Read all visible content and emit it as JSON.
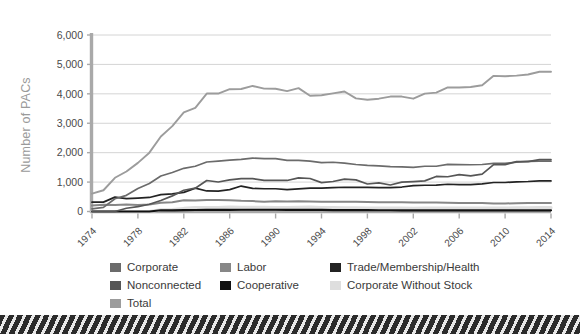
{
  "chart_data": {
    "type": "line",
    "title": "",
    "subtitle": "",
    "xlabel": "",
    "ylabel": "Number of PACs",
    "xlim": [
      1974,
      2014
    ],
    "ylim": [
      0,
      6000
    ],
    "grid": true,
    "legend_position": "bottom",
    "ytick_labels": [
      "6,000",
      "5,000",
      "4,000",
      "3,000",
      "2,000",
      "1,000",
      "0"
    ],
    "ytick_values": [
      6000,
      5000,
      4000,
      3000,
      2000,
      1000,
      0
    ],
    "xtick_labels": [
      "1974",
      "1978",
      "1982",
      "1986",
      "1990",
      "1994",
      "1998",
      "2002",
      "2006",
      "2010",
      "2014"
    ],
    "xtick_values": [
      1974,
      1978,
      1982,
      1986,
      1990,
      1994,
      1998,
      2002,
      2006,
      2010,
      2014
    ],
    "x": [
      1974,
      1975,
      1976,
      1977,
      1978,
      1979,
      1980,
      1981,
      1982,
      1983,
      1984,
      1985,
      1986,
      1987,
      1988,
      1989,
      1990,
      1991,
      1992,
      1993,
      1994,
      1995,
      1996,
      1997,
      1998,
      1999,
      2000,
      2001,
      2002,
      2003,
      2004,
      2005,
      2006,
      2007,
      2008,
      2009,
      2010,
      2011,
      2012,
      2013,
      2014
    ],
    "series": [
      {
        "name": "Total",
        "color": "#9c9c9c",
        "values": [
          608,
          722,
          1146,
          1360,
          1653,
          2000,
          2551,
          2901,
          3371,
          3525,
          4009,
          4009,
          4157,
          4165,
          4268,
          4178,
          4172,
          4094,
          4195,
          3937,
          3954,
          4016,
          4079,
          3844,
          3798,
          3835,
          3907,
          3907,
          3835,
          4007,
          4040,
          4217,
          4217,
          4234,
          4292,
          4611,
          4600,
          4618,
          4657,
          4750,
          4750
        ]
      },
      {
        "name": "Nonconnected",
        "color": "#565656",
        "values": [
          0,
          0,
          0,
          110,
          165,
          247,
          374,
          531,
          723,
          793,
          1053,
          1003,
          1077,
          1115,
          1115,
          1060,
          1062,
          1055,
          1145,
          1121,
          980,
          1020,
          1103,
          1075,
          935,
          972,
          902,
          998,
          1018,
          1040,
          1192,
          1182,
          1254,
          1214,
          1272,
          1594,
          1594,
          1694,
          1696,
          1764,
          1764
        ]
      },
      {
        "name": "Corporate",
        "color": "#6b6b6b",
        "values": [
          89,
          139,
          433,
          550,
          785,
          950,
          1206,
          1327,
          1469,
          1538,
          1682,
          1710,
          1744,
          1775,
          1816,
          1796,
          1795,
          1738,
          1735,
          1715,
          1660,
          1674,
          1642,
          1597,
          1567,
          1548,
          1523,
          1520,
          1497,
          1538,
          1538,
          1600,
          1596,
          1590,
          1598,
          1639,
          1639,
          1680,
          1702,
          1710,
          1710
        ]
      },
      {
        "name": "Trade/Membership/Health",
        "color": "#232323",
        "values": [
          318,
          318,
          489,
          438,
          453,
          477,
          576,
          601,
          649,
          792,
          698,
          695,
          745,
          865,
          786,
          774,
          774,
          745,
          770,
          793,
          792,
          815,
          825,
          820,
          821,
          812,
          812,
          832,
          877,
          893,
          900,
          926,
          911,
          912,
          942,
          986,
          986,
          1008,
          1020,
          1041,
          1041
        ]
      },
      {
        "name": "Labor",
        "color": "#878787",
        "values": [
          201,
          226,
          224,
          234,
          217,
          240,
          297,
          318,
          380,
          378,
          394,
          388,
          384,
          364,
          354,
          332,
          346,
          338,
          347,
          337,
          333,
          334,
          332,
          332,
          321,
          318,
          316,
          316,
          310,
          305,
          302,
          297,
          293,
          290,
          286,
          272,
          272,
          282,
          285,
          287,
          287
        ]
      },
      {
        "name": "Corporate Without Stock",
        "color": "#dedede",
        "values": [
          0,
          0,
          0,
          0,
          0,
          0,
          56,
          62,
          103,
          129,
          130,
          134,
          151,
          145,
          138,
          137,
          136,
          136,
          142,
          146,
          136,
          129,
          127,
          123,
          115,
          114,
          114,
          114,
          110,
          114,
          114,
          118,
          118,
          116,
          115,
          116,
          116,
          124,
          127,
          130,
          130
        ]
      },
      {
        "name": "Cooperative",
        "color": "#111111",
        "values": [
          0,
          0,
          0,
          0,
          0,
          0,
          42,
          41,
          47,
          51,
          52,
          54,
          56,
          59,
          59,
          59,
          59,
          57,
          56,
          56,
          53,
          48,
          44,
          44,
          45,
          42,
          42,
          39,
          38,
          39,
          39,
          38,
          39,
          39,
          38,
          38,
          38,
          39,
          40,
          40,
          40
        ]
      }
    ]
  },
  "legend": {
    "items": [
      {
        "label": "Corporate",
        "color": "#6b6b6b"
      },
      {
        "label": "Labor",
        "color": "#878787"
      },
      {
        "label": "Trade/Membership/Health",
        "color": "#232323"
      },
      {
        "label": "Nonconnected",
        "color": "#565656"
      },
      {
        "label": "Cooperative",
        "color": "#111111"
      },
      {
        "label": "Corporate Without Stock",
        "color": "#dedede"
      },
      {
        "label": "Total",
        "color": "#9c9c9c"
      }
    ]
  }
}
